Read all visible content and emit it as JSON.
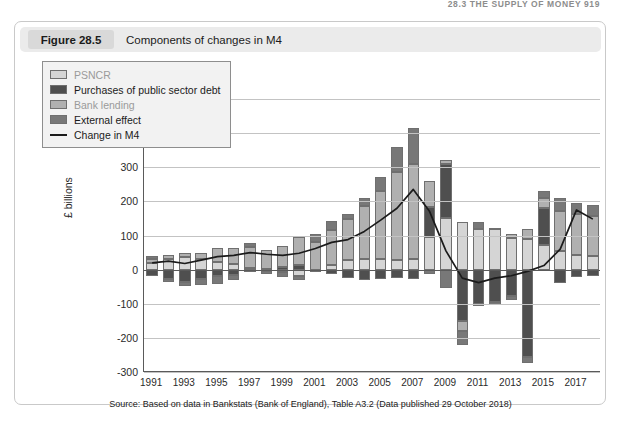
{
  "running_head": "28.3  THE SUPPLY OF MONEY   919",
  "figure": {
    "number_label": "Figure 28.5",
    "title": "Components of changes in M4",
    "source": "Source: Based on data in Bankstats (Bank of England), Table A3.2 (Data published 29 October 2018)"
  },
  "colors": {
    "psncr": "#d5d5d5",
    "purchases_of_public_sector_debt": "#4f4f4f",
    "bank_lending": "#b0b0b0",
    "external_effect": "#787878",
    "change_in_m4_line": "#1b1b1b",
    "gridline": "#c3c3c3",
    "axis": "#5a5a5a",
    "legend_background": "#f2f2f2",
    "caption_bar": "#ebebeb",
    "caption_badge": "#d9d9d9",
    "figure_border": "#c9c9c9"
  },
  "legend": {
    "items": [
      {
        "label": "PSNCR",
        "swatch": "psncr",
        "type": "swatch",
        "muted": true
      },
      {
        "label": "Purchases of public sector debt",
        "swatch": "purchases_of_public_sector_debt",
        "type": "swatch",
        "muted": false
      },
      {
        "label": "Bank lending",
        "swatch": "bank_lending",
        "type": "swatch",
        "muted": true
      },
      {
        "label": "External effect",
        "swatch": "external_effect",
        "type": "swatch",
        "muted": false
      },
      {
        "label": "Change in M4",
        "swatch": "change_in_m4_line",
        "type": "line",
        "muted": false
      }
    ]
  },
  "chart_data": {
    "type": "bar",
    "stacked": true,
    "title": "Components of changes in M4",
    "xlabel": "",
    "ylabel": "£ billions",
    "ylim": [
      -300,
      500
    ],
    "ytick_step": 100,
    "yticks": [
      500,
      400,
      300,
      200,
      100,
      0,
      -100,
      -200,
      -300
    ],
    "ytick_labels": [
      "500",
      "400",
      "300",
      "200",
      "100",
      "0",
      "-100",
      "-200",
      "-300"
    ],
    "grid": true,
    "legend_position": "upper-left-inside",
    "categories": [
      1991,
      1992,
      1993,
      1994,
      1995,
      1996,
      1997,
      1998,
      1999,
      2000,
      2001,
      2002,
      2003,
      2004,
      2005,
      2006,
      2007,
      2008,
      2009,
      2010,
      2011,
      2012,
      2013,
      2014,
      2015,
      2016,
      2017,
      2018
    ],
    "xtick_labels": [
      "1991",
      "1993",
      "1995",
      "1997",
      "1999",
      "2001",
      "2003",
      "2005",
      "2007",
      "2009",
      "2011",
      "2013",
      "2015",
      "2017"
    ],
    "series": [
      {
        "name": "PSNCR",
        "key": "psncr",
        "values": [
          18,
          30,
          38,
          30,
          22,
          17,
          5,
          -3,
          -8,
          -18,
          -2,
          15,
          28,
          32,
          30,
          28,
          30,
          95,
          150,
          140,
          120,
          118,
          92,
          90,
          72,
          55,
          42,
          40
        ]
      },
      {
        "name": "Purchases of public sector debt",
        "key": "purchases_of_public_sector_debt",
        "values": [
          -20,
          -28,
          -36,
          -28,
          -20,
          -15,
          -4,
          2,
          7,
          15,
          0,
          -14,
          -26,
          -30,
          -28,
          -26,
          -28,
          88,
          160,
          -150,
          -100,
          -95,
          -78,
          -255,
          108,
          -38,
          -22,
          -18
        ]
      },
      {
        "name": "Bank lending",
        "key": "bank_lending",
        "values": [
          12,
          14,
          10,
          18,
          40,
          45,
          62,
          56,
          62,
          80,
          82,
          100,
          120,
          155,
          200,
          258,
          280,
          78,
          12,
          -30,
          -8,
          5,
          12,
          30,
          30,
          118,
          122,
          118
        ]
      },
      {
        "name": "External effect",
        "key": "external_effect",
        "values": [
          10,
          -8,
          -12,
          -18,
          -22,
          -15,
          12,
          -10,
          -14,
          -12,
          22,
          28,
          16,
          22,
          40,
          72,
          105,
          -12,
          -55,
          -40,
          20,
          -8,
          -10,
          -20,
          20,
          38,
          30,
          32
        ]
      }
    ],
    "line_series": {
      "name": "Change in M4",
      "key": "change_in_m4",
      "values": [
        20,
        25,
        18,
        28,
        38,
        42,
        50,
        45,
        42,
        48,
        62,
        80,
        88,
        112,
        145,
        180,
        235,
        170,
        55,
        -25,
        -38,
        -25,
        -18,
        -5,
        12,
        60,
        175,
        148
      ]
    }
  }
}
